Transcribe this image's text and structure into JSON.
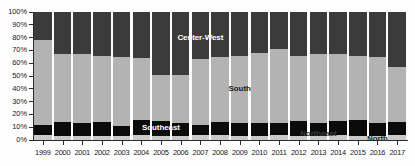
{
  "chart_data": {
    "type": "bar",
    "stacked": true,
    "normalized": true,
    "title": "",
    "subtitle": "",
    "xlabel": "",
    "ylabel": "",
    "ylim": [
      0,
      100
    ],
    "grid": false,
    "legend_position": "inline-annotations",
    "categories": [
      "1999",
      "2000",
      "2001",
      "2002",
      "2003",
      "2004",
      "2005",
      "2006",
      "2007",
      "2008",
      "2009",
      "2010",
      "2011",
      "2012",
      "2013",
      "2014",
      "2015",
      "2016",
      "2017"
    ],
    "y_ticks": [
      "0%",
      "10%",
      "20%",
      "30%",
      "40%",
      "50%",
      "60%",
      "70%",
      "80%",
      "90%",
      "100%"
    ],
    "y_tick_values": [
      0,
      10,
      20,
      30,
      40,
      50,
      60,
      70,
      80,
      90,
      100
    ],
    "series": [
      {
        "name": "North",
        "color": "#c9c9c9",
        "values": [
          4,
          3,
          3,
          3,
          3,
          4,
          3,
          3,
          4,
          4,
          3,
          3,
          4,
          3,
          3,
          4,
          3,
          3,
          4
        ]
      },
      {
        "name": "Northeast",
        "color": "#0b0b0b",
        "values": [
          8,
          11,
          10,
          11,
          8,
          12,
          12,
          10,
          8,
          10,
          10,
          10,
          9,
          12,
          10,
          11,
          13,
          10,
          10
        ]
      },
      {
        "name": "South",
        "color": "#b3b3b3",
        "values": [
          66,
          53,
          54,
          52,
          54,
          48,
          36,
          38,
          51,
          51,
          53,
          55,
          58,
          51,
          54,
          52,
          50,
          52,
          43
        ]
      },
      {
        "name": "Center-West",
        "color": "#3b3b3b",
        "values": [
          22,
          33,
          33,
          34,
          35,
          36,
          49,
          49,
          37,
          35,
          34,
          32,
          29,
          34,
          33,
          33,
          34,
          35,
          43
        ]
      }
    ],
    "annotations": [
      {
        "text": "Center-West",
        "series": "Center-West"
      },
      {
        "text": "South",
        "series": "South"
      },
      {
        "text": "Southeast",
        "series": "Southeast"
      },
      {
        "text": "Northeast",
        "series": "Northeast"
      },
      {
        "text": "North",
        "series": "North"
      }
    ]
  },
  "labels": {
    "center_west": "Center-West",
    "south": "South",
    "southeast": "Southeast",
    "northeast": "Northeast",
    "north": "North"
  }
}
